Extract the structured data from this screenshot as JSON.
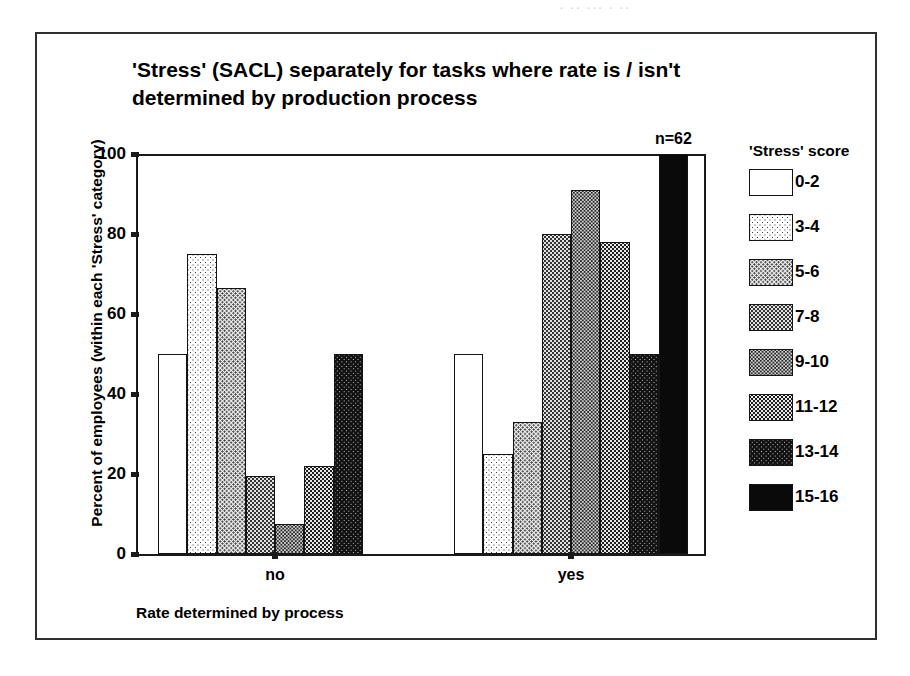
{
  "scan_artifact_text": "· ·· ··· · ··",
  "chart_data": {
    "type": "bar",
    "title": "'Stress' (SACL) separately for tasks where rate is / isn't determined by production process",
    "title_lines": [
      "'Stress' (SACL) separately for tasks where rate is / isn't",
      "determined by production process"
    ],
    "xlabel": "Rate determined by process",
    "ylabel": "Percent of employees (within each 'Stress' category)",
    "categories": [
      "no",
      "yes"
    ],
    "ylim": [
      0,
      100
    ],
    "yticks": [
      0,
      20,
      40,
      60,
      80,
      100
    ],
    "ytick_labels": [
      "0",
      "20",
      "40",
      "60",
      "80",
      "100"
    ],
    "grid": false,
    "legend_title": "'Stress' score",
    "legend_position": "right",
    "series": [
      {
        "name": "0-2",
        "pattern": "p0",
        "values": [
          50.0,
          50.0
        ]
      },
      {
        "name": "3-4",
        "pattern": "p1",
        "values": [
          75.0,
          25.0
        ]
      },
      {
        "name": "5-6",
        "pattern": "p2",
        "values": [
          66.5,
          33.0
        ]
      },
      {
        "name": "7-8",
        "pattern": "p3",
        "values": [
          19.5,
          80.0
        ]
      },
      {
        "name": "9-10",
        "pattern": "p4",
        "values": [
          7.5,
          91.0
        ]
      },
      {
        "name": "11-12",
        "pattern": "p5",
        "values": [
          22.0,
          78.0
        ]
      },
      {
        "name": "13-14",
        "pattern": "p6",
        "values": [
          50.0,
          50.0
        ]
      },
      {
        "name": "15-16",
        "pattern": "p7",
        "values": [
          0.0,
          100.0
        ]
      }
    ],
    "annotations": [
      {
        "text": "n=62",
        "group": 1,
        "series_index": 7,
        "value": 100
      }
    ]
  },
  "colors": {
    "axis": "#1a1a1a",
    "frame": "#2e2e2e",
    "bar_outline": "#141414",
    "background": "#ffffff"
  }
}
